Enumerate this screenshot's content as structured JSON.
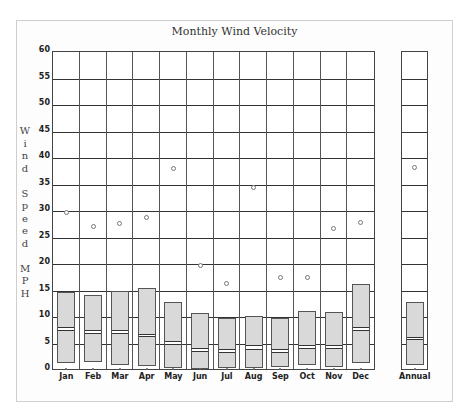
{
  "chart_data": {
    "type": "box",
    "title": "Monthly Wind Velocity",
    "ylabel": "Wind Speed MPH",
    "ylabel_letters": [
      "W",
      "i",
      "n",
      "d",
      "",
      "S",
      "p",
      "e",
      "e",
      "d",
      "",
      "M",
      "P",
      "H"
    ],
    "xlabel": "",
    "ylim": [
      0,
      60
    ],
    "yticks": [
      0,
      5,
      10,
      15,
      20,
      25,
      30,
      35,
      40,
      45,
      50,
      55,
      60
    ],
    "grid": true,
    "legend": null,
    "categories": [
      "Jan",
      "Feb",
      "Mar",
      "Apr",
      "May",
      "Jun",
      "Jul",
      "Aug",
      "Sep",
      "Oct",
      "Nov",
      "Dec"
    ],
    "series": [
      {
        "name": "box_low",
        "values": [
          1.3,
          1.5,
          0.9,
          0.7,
          0.3,
          0.2,
          0.3,
          0.3,
          0.5,
          1.0,
          0.5,
          1.3
        ]
      },
      {
        "name": "box_high",
        "values": [
          14.8,
          14.1,
          15.0,
          15.4,
          12.8,
          10.7,
          9.8,
          10.2,
          9.8,
          11.1,
          10.9,
          16.2
        ]
      },
      {
        "name": "median_upper",
        "values": [
          8.1,
          7.5,
          7.5,
          6.8,
          5.4,
          4.1,
          3.9,
          4.7,
          3.9,
          4.7,
          4.7,
          8.1
        ]
      },
      {
        "name": "median_lower",
        "values": [
          7.3,
          6.8,
          6.8,
          6.2,
          4.7,
          3.4,
          3.2,
          3.8,
          3.2,
          4.0,
          4.0,
          7.4
        ]
      },
      {
        "name": "max",
        "values": [
          29.8,
          27.0,
          27.6,
          28.7,
          38.0,
          19.7,
          16.3,
          34.4,
          17.5,
          17.5,
          26.7,
          27.9
        ]
      },
      {
        "name": "min",
        "values": [
          0,
          0,
          0,
          0,
          0,
          0,
          0,
          0,
          0,
          0,
          0,
          0
        ]
      }
    ],
    "annual": {
      "label": "Annual",
      "box_low": 0.9,
      "box_high": 12.8,
      "median_upper": 6.3,
      "median_lower": 6.0,
      "max": 38.3,
      "min": 0
    }
  }
}
